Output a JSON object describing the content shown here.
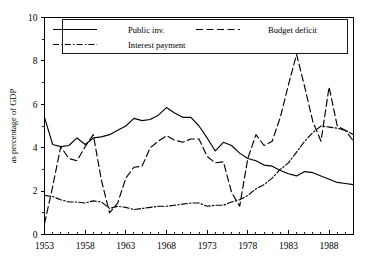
{
  "chart_data": {
    "type": "line",
    "title": "",
    "subtitle": "",
    "xlabel": "",
    "ylabel": "as percentage of GDP",
    "xlim": [
      1953,
      1991
    ],
    "ylim": [
      0,
      10
    ],
    "yticks": [
      0,
      2,
      4,
      6,
      8,
      10
    ],
    "ytick_labels": [
      "0",
      "2",
      "4",
      "6",
      "8",
      "10"
    ],
    "xticks": [
      1953,
      1958,
      1963,
      1968,
      1973,
      1978,
      1983,
      1988
    ],
    "xtick_labels": [
      "1953",
      "1958",
      "1963",
      "1968",
      "1973",
      "1978",
      "1983",
      "1988"
    ],
    "x_minor_tick_step": 1,
    "grid": false,
    "legend_position": "top",
    "x": [
      1953,
      1954,
      1955,
      1956,
      1957,
      1958,
      1959,
      1960,
      1961,
      1962,
      1963,
      1964,
      1965,
      1966,
      1967,
      1968,
      1969,
      1970,
      1971,
      1972,
      1973,
      1974,
      1975,
      1976,
      1977,
      1978,
      1979,
      1980,
      1981,
      1982,
      1983,
      1984,
      1985,
      1986,
      1987,
      1988,
      1989,
      1990,
      1991
    ],
    "series": [
      {
        "name": "Public inv.",
        "linestyle": "solid",
        "color": "#000000",
        "values": [
          5.4,
          4.15,
          4.05,
          4.1,
          4.45,
          4.15,
          4.45,
          4.5,
          4.6,
          4.8,
          5.0,
          5.35,
          5.25,
          5.3,
          5.5,
          5.85,
          5.6,
          5.4,
          5.4,
          5.0,
          4.45,
          3.85,
          4.25,
          4.1,
          3.75,
          3.5,
          3.4,
          3.2,
          3.15,
          2.95,
          2.8,
          2.7,
          2.9,
          2.85,
          2.7,
          2.55,
          2.4,
          2.35,
          2.3
        ]
      },
      {
        "name": "Budget deficit",
        "linestyle": "dashed",
        "color": "#000000",
        "values": [
          0.5,
          2.2,
          4.05,
          3.5,
          3.4,
          4.05,
          4.6,
          2.5,
          1.0,
          1.45,
          2.6,
          3.1,
          3.15,
          4.0,
          4.3,
          4.55,
          4.35,
          4.25,
          4.4,
          4.4,
          3.6,
          3.3,
          3.35,
          1.95,
          1.3,
          3.5,
          4.6,
          4.1,
          4.3,
          5.4,
          6.9,
          8.3,
          6.8,
          5.2,
          4.3,
          6.8,
          5.0,
          4.8,
          4.3
        ]
      },
      {
        "name": "Interest payment",
        "linestyle": "dashdot",
        "color": "#000000",
        "values": [
          1.8,
          1.75,
          1.6,
          1.5,
          1.5,
          1.45,
          1.55,
          1.5,
          1.2,
          1.3,
          1.25,
          1.15,
          1.2,
          1.25,
          1.3,
          1.3,
          1.35,
          1.4,
          1.45,
          1.45,
          1.3,
          1.35,
          1.35,
          1.5,
          1.6,
          1.8,
          2.1,
          2.3,
          2.6,
          3.0,
          3.3,
          3.8,
          4.3,
          4.7,
          5.0,
          4.95,
          4.9,
          4.8,
          4.6
        ]
      }
    ],
    "legend_entries": [
      {
        "label": "Public inv.",
        "linestyle": "solid"
      },
      {
        "label": "Budget deficit",
        "linestyle": "dashed"
      },
      {
        "label": "Interest payment",
        "linestyle": "dashdot"
      }
    ]
  }
}
